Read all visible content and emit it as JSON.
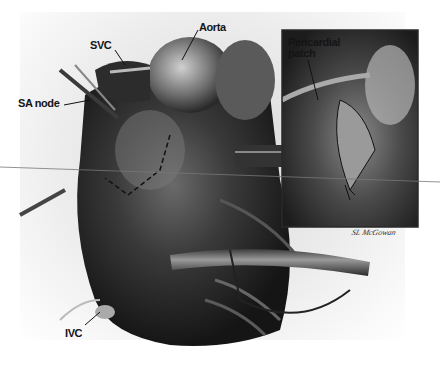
{
  "figure": {
    "type": "surgical illustration",
    "style": "grayscale",
    "labels": {
      "svc": "SVC",
      "aorta": "Aorta",
      "sa_node": "SA node",
      "ivc": "IVC",
      "pericardial_patch": "Pericardial\npatch"
    },
    "signature": "SL McGowan",
    "colors": {
      "background": "#ffffff",
      "tissue_dark": "#1e1e1e",
      "tissue_mid": "#555555",
      "highlight": "#bdbdbd",
      "inset_border": "#2a2a2a"
    }
  }
}
